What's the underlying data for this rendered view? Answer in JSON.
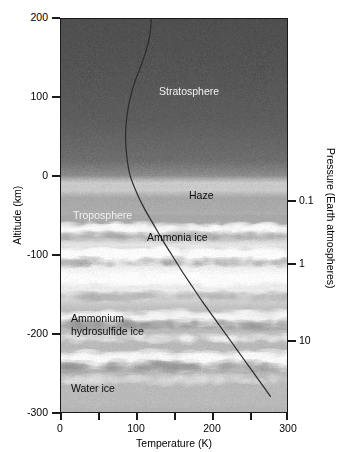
{
  "figure": {
    "title_visible": false
  },
  "axes": {
    "x": {
      "label": "Temperature (K)",
      "ticks": [
        {
          "value": 0,
          "label": "0"
        },
        {
          "value": 50,
          "label": ""
        },
        {
          "value": 100,
          "label": "100"
        },
        {
          "value": 150,
          "label": ""
        },
        {
          "value": 200,
          "label": "200"
        },
        {
          "value": 250,
          "label": ""
        },
        {
          "value": 300,
          "label": "300"
        }
      ],
      "min": 0,
      "max": 300
    },
    "y_left": {
      "label": "Altitude (km)",
      "ticks": [
        {
          "value": 200,
          "label": "200"
        },
        {
          "value": 100,
          "label": "100"
        },
        {
          "value": 0,
          "label": "0"
        },
        {
          "value": -100,
          "label": "-100"
        },
        {
          "value": -200,
          "label": "-200"
        },
        {
          "value": -300,
          "label": "-300"
        }
      ],
      "min": -300,
      "max": 200
    },
    "y_right": {
      "label": "Pressure (Earth atmospheres)",
      "ticks": [
        {
          "altitude_km": -30,
          "label": "0.1"
        },
        {
          "altitude_km": -110,
          "label": "1"
        },
        {
          "altitude_km": -208,
          "label": "10"
        }
      ]
    }
  },
  "annotations": [
    {
      "id": "stratosphere",
      "text": "Stratosphere",
      "color": "light"
    },
    {
      "id": "troposphere",
      "text": "Troposphere",
      "color": "light"
    },
    {
      "id": "haze",
      "text": "Haze",
      "color": "dark"
    },
    {
      "id": "ammonia-ice",
      "text": "Ammonia ice",
      "color": "dark"
    },
    {
      "id": "ammonium-hydrosulfide-ice",
      "text": "Ammonium\nhydrosulfide ice",
      "color": "dark"
    },
    {
      "id": "water-ice",
      "text": "Water ice",
      "color": "dark"
    }
  ],
  "colors": {
    "axis": "#1a1a1a",
    "curve": "#2b2b2b",
    "background": "#ffffff",
    "upper_atmosphere": "#5c5c5c",
    "cloud_bright": "#fbfbfb"
  },
  "chart_data": {
    "type": "line",
    "title": "",
    "xlabel": "Temperature (K)",
    "ylabel": "Altitude (km)",
    "y2label": "Pressure (Earth atmospheres)",
    "xlim": [
      0,
      300
    ],
    "ylim": [
      -300,
      200
    ],
    "grid": false,
    "legend": "none",
    "series": [
      {
        "name": "Temperature profile",
        "x": [
          120,
          118,
          113,
          106,
          98,
          92,
          88,
          86,
          86,
          88,
          92,
          100,
          110,
          122,
          134,
          147,
          160,
          174,
          188,
          203,
          218,
          233,
          248,
          263,
          278
        ],
        "y": [
          200,
          180,
          160,
          140,
          120,
          100,
          80,
          60,
          40,
          20,
          0,
          -20,
          -40,
          -60,
          -80,
          -100,
          -120,
          -140,
          -160,
          -180,
          -200,
          -220,
          -240,
          -260,
          -280
        ]
      }
    ],
    "regions": [
      {
        "name": "Stratosphere",
        "altitude_range_km": [
          0,
          200
        ]
      },
      {
        "name": "Troposphere",
        "altitude_range_km": [
          -300,
          0
        ]
      },
      {
        "name": "Haze",
        "altitude_km": -20
      },
      {
        "name": "Ammonia ice",
        "altitude_km": -75
      },
      {
        "name": "Ammonium hydrosulfide ice",
        "altitude_km": -195
      },
      {
        "name": "Water ice",
        "altitude_km": -265
      }
    ]
  }
}
